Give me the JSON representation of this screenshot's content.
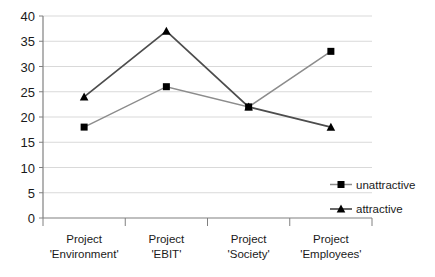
{
  "chart_data": {
    "type": "line",
    "title": "",
    "subtitle": "",
    "xlabel": "",
    "ylabel": "",
    "categories": [
      "Project\n'Environment'",
      "Project\n'EBIT'",
      "Project\n'Society'",
      "Project\n'Employees'"
    ],
    "category_lines": [
      [
        "Project",
        "'Environment'"
      ],
      [
        "Project",
        "'EBIT'"
      ],
      [
        "Project",
        "'Society'"
      ],
      [
        "Project",
        "'Employees'"
      ]
    ],
    "series": [
      {
        "name": "unattractive",
        "marker": "square",
        "color": "#808080",
        "marker_color": "#000000",
        "values": [
          18,
          26,
          22,
          33
        ]
      },
      {
        "name": "attractive",
        "marker": "triangle",
        "color": "#4d4d4d",
        "marker_color": "#000000",
        "values": [
          24,
          37,
          22,
          18
        ]
      }
    ],
    "ylim": [
      0,
      40
    ],
    "ytick_step": 5,
    "yticks": [
      0,
      5,
      10,
      15,
      20,
      25,
      30,
      35,
      40
    ],
    "ytick_labels": [
      "0",
      "5",
      "10",
      "15",
      "20",
      "25",
      "30",
      "35",
      "40"
    ],
    "grid": true,
    "grid_axis": "y",
    "grid_color": "#d9d9d9",
    "axis_color": "#808080",
    "legend": {
      "position": "right-middle",
      "entries": [
        "unattractive",
        "attractive"
      ]
    },
    "background_color": "#ffffff"
  },
  "legend": {
    "entries": [
      {
        "label": "unattractive"
      },
      {
        "label": "attractive"
      }
    ]
  },
  "axes": {
    "y": {
      "labels": [
        "40",
        "35",
        "30",
        "25",
        "20",
        "15",
        "10",
        "5",
        "0"
      ]
    },
    "x": {
      "labels": [
        {
          "line1": "Project",
          "line2": "'Environment'"
        },
        {
          "line1": "Project",
          "line2": "'EBIT'"
        },
        {
          "line1": "Project",
          "line2": "'Society'"
        },
        {
          "line1": "Project",
          "line2": "'Employees'"
        }
      ]
    }
  }
}
